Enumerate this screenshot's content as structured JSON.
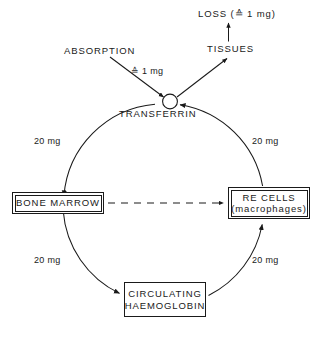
{
  "diagram": {
    "type": "cycle-diagram",
    "stroke_color": "#1a1a1a",
    "background_color": "#ffffff",
    "nodes": {
      "loss": {
        "label": "LOSS (≙11 mg)",
        "text": "LOSS (≙ 1 mg)"
      },
      "tissues": {
        "label": "TISSUES"
      },
      "absorption": {
        "label": "ABSORPTION"
      },
      "absorption_amount": {
        "label": "≙ 1 mg"
      },
      "transferrin": {
        "label": "TRANSFERRIN"
      },
      "bone_marrow": {
        "label": "BONE MARROW"
      },
      "re_cells": {
        "label": "RE CELLS",
        "sublabel": "(macrophages)"
      },
      "haemoglobin": {
        "line1": "CIRCULATING",
        "line2": "HAEMOGLOBIN"
      }
    },
    "flow_amounts": {
      "transferrin_to_bone_marrow": "20 mg",
      "re_cells_to_transferrin": "20 mg",
      "bone_marrow_to_haemoglobin": "20 mg",
      "haemoglobin_to_re_cells": "20 mg"
    }
  }
}
